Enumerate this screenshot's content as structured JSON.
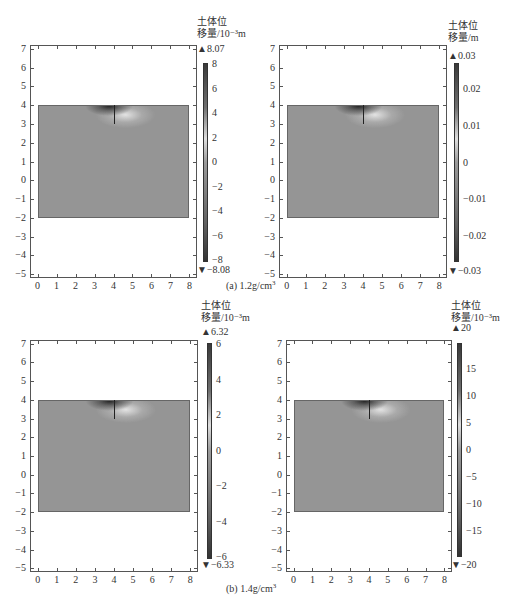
{
  "header": {
    "clipped_text_visible": true
  },
  "chart_data": [
    {
      "type": "heatmap",
      "panel": "a-left",
      "group_caption": "(a) 1.2g/cm³",
      "title": "",
      "xlabel": "",
      "ylabel": "",
      "x_ticks": [
        "0",
        "1",
        "2",
        "3",
        "4",
        "5",
        "6",
        "7",
        "8"
      ],
      "y_ticks": [
        "7",
        "6",
        "5",
        "4",
        "3",
        "2",
        "1",
        "0",
        "−1",
        "−2",
        "−3",
        "−4",
        "−5"
      ],
      "xlim": [
        -0.4,
        8.4
      ],
      "ylim": [
        -5.2,
        7.2
      ],
      "soil_region": {
        "x": [
          0,
          8
        ],
        "y": [
          -2,
          4
        ]
      },
      "crack": {
        "x": 4,
        "y": [
          3,
          4
        ]
      },
      "colorbar": {
        "title_line1": "土体位",
        "title_line2": "移量/10⁻³m",
        "max": "8.07",
        "min": "−8.08",
        "ticks": [
          "8",
          "6",
          "4",
          "2",
          "0",
          "−2",
          "−4",
          "−6",
          "−8"
        ]
      }
    },
    {
      "type": "heatmap",
      "panel": "a-right",
      "group_caption": "(a) 1.2g/cm³",
      "x_ticks": [
        "0",
        "1",
        "2",
        "3",
        "4",
        "5",
        "6",
        "7",
        "8"
      ],
      "y_ticks": [
        "7",
        "6",
        "5",
        "4",
        "3",
        "2",
        "1",
        "0",
        "−1",
        "−2",
        "−3",
        "−4",
        "−5"
      ],
      "soil_region": {
        "x": [
          0,
          8
        ],
        "y": [
          -2,
          4
        ]
      },
      "crack": {
        "x": 4,
        "y": [
          3,
          4
        ]
      },
      "colorbar": {
        "title_line1": "土体位",
        "title_line2": "移量/m",
        "max": "0.03",
        "min": "−0.03",
        "ticks": [
          "0.02",
          "0.01",
          "0",
          "−0.01",
          "−0.02"
        ]
      }
    },
    {
      "type": "heatmap",
      "panel": "b-left",
      "group_caption": "(b) 1.4g/cm³",
      "x_ticks": [
        "0",
        "1",
        "2",
        "3",
        "4",
        "5",
        "6",
        "7",
        "8"
      ],
      "y_ticks": [
        "7",
        "6",
        "5",
        "4",
        "3",
        "2",
        "1",
        "0",
        "−1",
        "−2",
        "−3",
        "−4",
        "−5"
      ],
      "soil_region": {
        "x": [
          0,
          8
        ],
        "y": [
          -2,
          4
        ]
      },
      "crack": {
        "x": 4,
        "y": [
          3,
          4
        ]
      },
      "colorbar": {
        "title_line1": "土体位",
        "title_line2": "移量/10⁻³m",
        "max": "6.32",
        "min": "−6.33",
        "ticks": [
          "6",
          "4",
          "2",
          "0",
          "−2",
          "−4",
          "−6"
        ]
      }
    },
    {
      "type": "heatmap",
      "panel": "b-right",
      "group_caption": "(b) 1.4g/cm³",
      "x_ticks": [
        "0",
        "1",
        "2",
        "3",
        "4",
        "5",
        "6",
        "7",
        "8"
      ],
      "y_ticks": [
        "7",
        "6",
        "5",
        "4",
        "3",
        "2",
        "1",
        "0",
        "−1",
        "−2",
        "−3",
        "−4",
        "−5"
      ],
      "soil_region": {
        "x": [
          0,
          8
        ],
        "y": [
          -2,
          4
        ]
      },
      "crack": {
        "x": 4,
        "y": [
          3,
          4
        ]
      },
      "colorbar": {
        "title_line1": "土体位",
        "title_line2": "移量/10⁻³m",
        "max": "20",
        "min": "−20",
        "ticks": [
          "15",
          "10",
          "5",
          "0",
          "−5",
          "−10",
          "−15"
        ]
      }
    }
  ],
  "captions": {
    "a": "(a) 1.2g/cm",
    "b": "(b) 1.4g/cm",
    "sup": "3"
  },
  "glyphs": {
    "up_triangle": "▲",
    "down_triangle": "▼"
  }
}
